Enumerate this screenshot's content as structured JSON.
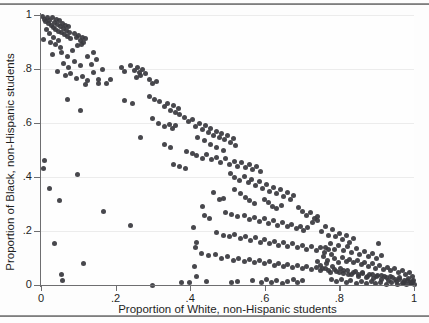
{
  "chart_data": {
    "type": "scatter",
    "title": "",
    "xlabel": "Proportion of White, non-Hispanic students",
    "ylabel": "Proportion of Black, non-Hispanic students",
    "xlim": [
      0,
      1
    ],
    "ylim": [
      0,
      1
    ],
    "xticks": [
      "0",
      ".2",
      ".4",
      ".6",
      ".8",
      "1"
    ],
    "xtick_values": [
      0,
      0.2,
      0.4,
      0.6,
      0.8,
      1
    ],
    "yticks": [
      "0",
      ".2",
      ".4",
      ".6",
      ".8",
      "1"
    ],
    "ytick_values": [
      0,
      0.2,
      0.4,
      0.6,
      0.8,
      1
    ],
    "grid": "horizontal-faint",
    "legend": "none",
    "marker": {
      "shape": "circle",
      "color": "#3a3a3f",
      "size_px": 5
    },
    "points": [
      [
        0.005,
        0.995
      ],
      [
        0.01,
        0.985
      ],
      [
        0.012,
        0.975
      ],
      [
        0.018,
        0.99
      ],
      [
        0.02,
        0.968
      ],
      [
        0.024,
        0.98
      ],
      [
        0.028,
        0.962
      ],
      [
        0.03,
        0.992
      ],
      [
        0.033,
        0.955
      ],
      [
        0.036,
        0.972
      ],
      [
        0.04,
        0.948
      ],
      [
        0.042,
        0.985
      ],
      [
        0.045,
        0.965
      ],
      [
        0.048,
        0.94
      ],
      [
        0.05,
        0.978
      ],
      [
        0.053,
        0.958
      ],
      [
        0.056,
        0.935
      ],
      [
        0.058,
        0.97
      ],
      [
        0.06,
        0.95
      ],
      [
        0.063,
        0.928
      ],
      [
        0.065,
        0.962
      ],
      [
        0.068,
        0.944
      ],
      [
        0.07,
        0.92
      ],
      [
        0.073,
        0.956
      ],
      [
        0.076,
        0.936
      ],
      [
        0.08,
        0.912
      ],
      [
        0.015,
        0.945
      ],
      [
        0.022,
        0.93
      ],
      [
        0.034,
        0.918
      ],
      [
        0.046,
        0.905
      ],
      [
        0.008,
        0.908
      ],
      [
        0.026,
        0.898
      ],
      [
        0.038,
        0.89
      ],
      [
        0.052,
        0.88
      ],
      [
        0.09,
        0.93
      ],
      [
        0.095,
        0.915
      ],
      [
        0.1,
        0.925
      ],
      [
        0.105,
        0.905
      ],
      [
        0.11,
        0.918
      ],
      [
        0.115,
        0.9
      ],
      [
        0.12,
        0.912
      ],
      [
        0.108,
        0.892
      ],
      [
        0.098,
        0.888
      ],
      [
        0.03,
        0.855
      ],
      [
        0.055,
        0.862
      ],
      [
        0.07,
        0.845
      ],
      [
        0.085,
        0.868
      ],
      [
        0.06,
        0.82
      ],
      [
        0.075,
        0.805
      ],
      [
        0.09,
        0.828
      ],
      [
        0.105,
        0.812
      ],
      [
        0.125,
        0.845
      ],
      [
        0.14,
        0.86
      ],
      [
        0.15,
        0.835
      ],
      [
        0.135,
        0.818
      ],
      [
        0.045,
        0.79
      ],
      [
        0.065,
        0.775
      ],
      [
        0.08,
        0.782
      ],
      [
        0.095,
        0.765
      ],
      [
        0.11,
        0.772
      ],
      [
        0.125,
        0.758
      ],
      [
        0.14,
        0.788
      ],
      [
        0.155,
        0.762
      ],
      [
        0.165,
        0.8
      ],
      [
        0.175,
        0.745
      ],
      [
        0.185,
        0.76
      ],
      [
        0.215,
        0.805
      ],
      [
        0.225,
        0.79
      ],
      [
        0.24,
        0.812
      ],
      [
        0.25,
        0.795
      ],
      [
        0.258,
        0.805
      ],
      [
        0.265,
        0.788
      ],
      [
        0.272,
        0.8
      ],
      [
        0.28,
        0.782
      ],
      [
        0.255,
        0.768
      ],
      [
        0.268,
        0.775
      ],
      [
        0.07,
        0.688
      ],
      [
        0.105,
        0.648
      ],
      [
        0.12,
        0.742
      ],
      [
        0.155,
        0.745
      ],
      [
        0.29,
        0.76
      ],
      [
        0.3,
        0.745
      ],
      [
        0.31,
        0.752
      ],
      [
        0.225,
        0.685
      ],
      [
        0.245,
        0.672
      ],
      [
        0.29,
        0.7
      ],
      [
        0.305,
        0.688
      ],
      [
        0.318,
        0.678
      ],
      [
        0.33,
        0.66
      ],
      [
        0.34,
        0.672
      ],
      [
        0.348,
        0.648
      ],
      [
        0.355,
        0.665
      ],
      [
        0.36,
        0.64
      ],
      [
        0.368,
        0.655
      ],
      [
        0.372,
        0.632
      ],
      [
        0.3,
        0.615
      ],
      [
        0.315,
        0.6
      ],
      [
        0.33,
        0.588
      ],
      [
        0.345,
        0.595
      ],
      [
        0.352,
        0.578
      ],
      [
        0.36,
        0.59
      ],
      [
        0.268,
        0.545
      ],
      [
        0.385,
        0.62
      ],
      [
        0.395,
        0.605
      ],
      [
        0.405,
        0.612
      ],
      [
        0.415,
        0.588
      ],
      [
        0.425,
        0.6
      ],
      [
        0.432,
        0.575
      ],
      [
        0.44,
        0.592
      ],
      [
        0.448,
        0.565
      ],
      [
        0.455,
        0.58
      ],
      [
        0.462,
        0.555
      ],
      [
        0.47,
        0.57
      ],
      [
        0.478,
        0.545
      ],
      [
        0.485,
        0.56
      ],
      [
        0.492,
        0.538
      ],
      [
        0.5,
        0.552
      ],
      [
        0.508,
        0.528
      ],
      [
        0.515,
        0.542
      ],
      [
        0.522,
        0.518
      ],
      [
        0.42,
        0.548
      ],
      [
        0.438,
        0.535
      ],
      [
        0.455,
        0.522
      ],
      [
        0.47,
        0.51
      ],
      [
        0.488,
        0.5
      ],
      [
        0.33,
        0.522
      ],
      [
        0.348,
        0.508
      ],
      [
        0.39,
        0.495
      ],
      [
        0.405,
        0.488
      ],
      [
        0.418,
        0.478
      ],
      [
        0.432,
        0.47
      ],
      [
        0.445,
        0.482
      ],
      [
        0.458,
        0.465
      ],
      [
        0.47,
        0.472
      ],
      [
        0.482,
        0.455
      ],
      [
        0.495,
        0.468
      ],
      [
        0.505,
        0.448
      ],
      [
        0.518,
        0.458
      ],
      [
        0.528,
        0.44
      ],
      [
        0.538,
        0.452
      ],
      [
        0.548,
        0.435
      ],
      [
        0.558,
        0.445
      ],
      [
        0.568,
        0.428
      ],
      [
        0.578,
        0.438
      ],
      [
        0.588,
        0.42
      ],
      [
        0.355,
        0.448
      ],
      [
        0.372,
        0.44
      ],
      [
        0.388,
        0.432
      ],
      [
        0.01,
        0.462
      ],
      [
        0.008,
        0.432
      ],
      [
        0.022,
        0.358
      ],
      [
        0.05,
        0.312
      ],
      [
        0.098,
        0.408
      ],
      [
        0.168,
        0.272
      ],
      [
        0.24,
        0.222
      ],
      [
        0.3,
        0.0
      ],
      [
        0.035,
        0.155
      ],
      [
        0.055,
        0.04
      ],
      [
        0.057,
        0.018
      ],
      [
        0.115,
        0.078
      ],
      [
        0.398,
        0.01
      ],
      [
        0.418,
        0.03
      ],
      [
        0.412,
        0.068
      ],
      [
        0.415,
        0.138
      ],
      [
        0.418,
        0.158
      ],
      [
        0.408,
        0.212
      ],
      [
        0.438,
        0.258
      ],
      [
        0.452,
        0.248
      ],
      [
        0.478,
        0.318
      ],
      [
        0.488,
        0.322
      ],
      [
        0.462,
        0.342
      ],
      [
        0.432,
        0.29
      ],
      [
        0.508,
        0.412
      ],
      [
        0.52,
        0.398
      ],
      [
        0.532,
        0.388
      ],
      [
        0.545,
        0.402
      ],
      [
        0.555,
        0.378
      ],
      [
        0.565,
        0.392
      ],
      [
        0.575,
        0.368
      ],
      [
        0.585,
        0.382
      ],
      [
        0.595,
        0.358
      ],
      [
        0.605,
        0.372
      ],
      [
        0.612,
        0.348
      ],
      [
        0.622,
        0.362
      ],
      [
        0.632,
        0.34
      ],
      [
        0.642,
        0.352
      ],
      [
        0.65,
        0.328
      ],
      [
        0.66,
        0.342
      ],
      [
        0.668,
        0.318
      ],
      [
        0.678,
        0.33
      ],
      [
        0.52,
        0.352
      ],
      [
        0.535,
        0.338
      ],
      [
        0.548,
        0.325
      ],
      [
        0.56,
        0.312
      ],
      [
        0.572,
        0.302
      ],
      [
        0.598,
        0.318
      ],
      [
        0.61,
        0.305
      ],
      [
        0.62,
        0.292
      ],
      [
        0.632,
        0.282
      ],
      [
        0.645,
        0.295
      ],
      [
        0.495,
        0.27
      ],
      [
        0.512,
        0.262
      ],
      [
        0.528,
        0.252
      ],
      [
        0.545,
        0.258
      ],
      [
        0.558,
        0.242
      ],
      [
        0.572,
        0.25
      ],
      [
        0.585,
        0.235
      ],
      [
        0.598,
        0.245
      ],
      [
        0.61,
        0.228
      ],
      [
        0.622,
        0.238
      ],
      [
        0.635,
        0.222
      ],
      [
        0.648,
        0.232
      ],
      [
        0.66,
        0.215
      ],
      [
        0.672,
        0.225
      ],
      [
        0.685,
        0.208
      ],
      [
        0.695,
        0.218
      ],
      [
        0.705,
        0.202
      ],
      [
        0.715,
        0.212
      ],
      [
        0.69,
        0.288
      ],
      [
        0.702,
        0.272
      ],
      [
        0.712,
        0.258
      ],
      [
        0.722,
        0.268
      ],
      [
        0.732,
        0.248
      ],
      [
        0.742,
        0.255
      ],
      [
        0.728,
        0.232
      ],
      [
        0.74,
        0.238
      ],
      [
        0.47,
        0.195
      ],
      [
        0.488,
        0.185
      ],
      [
        0.505,
        0.178
      ],
      [
        0.52,
        0.188
      ],
      [
        0.535,
        0.172
      ],
      [
        0.548,
        0.18
      ],
      [
        0.562,
        0.165
      ],
      [
        0.575,
        0.175
      ],
      [
        0.588,
        0.158
      ],
      [
        0.6,
        0.168
      ],
      [
        0.612,
        0.152
      ],
      [
        0.625,
        0.162
      ],
      [
        0.638,
        0.148
      ],
      [
        0.65,
        0.158
      ],
      [
        0.662,
        0.142
      ],
      [
        0.675,
        0.152
      ],
      [
        0.688,
        0.138
      ],
      [
        0.7,
        0.148
      ],
      [
        0.712,
        0.132
      ],
      [
        0.725,
        0.142
      ],
      [
        0.738,
        0.128
      ],
      [
        0.75,
        0.138
      ],
      [
        0.76,
        0.122
      ],
      [
        0.772,
        0.132
      ],
      [
        0.752,
        0.198
      ],
      [
        0.762,
        0.215
      ],
      [
        0.772,
        0.185
      ],
      [
        0.782,
        0.205
      ],
      [
        0.79,
        0.178
      ],
      [
        0.8,
        0.192
      ],
      [
        0.808,
        0.168
      ],
      [
        0.818,
        0.182
      ],
      [
        0.828,
        0.158
      ],
      [
        0.838,
        0.172
      ],
      [
        0.43,
        0.118
      ],
      [
        0.45,
        0.108
      ],
      [
        0.468,
        0.112
      ],
      [
        0.485,
        0.098
      ],
      [
        0.5,
        0.105
      ],
      [
        0.515,
        0.092
      ],
      [
        0.53,
        0.1
      ],
      [
        0.545,
        0.088
      ],
      [
        0.558,
        0.095
      ],
      [
        0.572,
        0.082
      ],
      [
        0.585,
        0.09
      ],
      [
        0.598,
        0.078
      ],
      [
        0.612,
        0.086
      ],
      [
        0.625,
        0.072
      ],
      [
        0.638,
        0.08
      ],
      [
        0.65,
        0.068
      ],
      [
        0.662,
        0.076
      ],
      [
        0.675,
        0.064
      ],
      [
        0.688,
        0.072
      ],
      [
        0.7,
        0.06
      ],
      [
        0.712,
        0.068
      ],
      [
        0.725,
        0.058
      ],
      [
        0.738,
        0.065
      ],
      [
        0.75,
        0.052
      ],
      [
        0.762,
        0.06
      ],
      [
        0.775,
        0.048
      ],
      [
        0.788,
        0.056
      ],
      [
        0.8,
        0.045
      ],
      [
        0.812,
        0.052
      ],
      [
        0.825,
        0.04
      ],
      [
        0.838,
        0.048
      ],
      [
        0.85,
        0.038
      ],
      [
        0.862,
        0.045
      ],
      [
        0.875,
        0.032
      ],
      [
        0.888,
        0.04
      ],
      [
        0.9,
        0.03
      ],
      [
        0.912,
        0.036
      ],
      [
        0.925,
        0.026
      ],
      [
        0.938,
        0.032
      ],
      [
        0.95,
        0.022
      ],
      [
        0.962,
        0.028
      ],
      [
        0.975,
        0.018
      ],
      [
        0.985,
        0.024
      ],
      [
        0.995,
        0.012
      ],
      [
        0.378,
        0.01
      ],
      [
        0.445,
        0.012
      ],
      [
        0.512,
        0.008
      ],
      [
        0.528,
        0.012
      ],
      [
        0.568,
        0.018
      ],
      [
        0.59,
        0.008
      ],
      [
        0.605,
        0.02
      ],
      [
        0.618,
        0.01
      ],
      [
        0.632,
        0.016
      ],
      [
        0.648,
        0.006
      ],
      [
        0.662,
        0.014
      ],
      [
        0.678,
        0.022
      ],
      [
        0.688,
        0.008
      ],
      [
        0.7,
        0.016
      ],
      [
        0.758,
        0.105
      ],
      [
        0.768,
        0.092
      ],
      [
        0.778,
        0.112
      ],
      [
        0.788,
        0.098
      ],
      [
        0.798,
        0.085
      ],
      [
        0.808,
        0.102
      ],
      [
        0.818,
        0.088
      ],
      [
        0.828,
        0.095
      ],
      [
        0.838,
        0.082
      ],
      [
        0.848,
        0.09
      ],
      [
        0.858,
        0.075
      ],
      [
        0.868,
        0.085
      ],
      [
        0.878,
        0.07
      ],
      [
        0.888,
        0.078
      ],
      [
        0.898,
        0.062
      ],
      [
        0.908,
        0.072
      ],
      [
        0.918,
        0.058
      ],
      [
        0.928,
        0.066
      ],
      [
        0.938,
        0.052
      ],
      [
        0.948,
        0.06
      ],
      [
        0.958,
        0.045
      ],
      [
        0.968,
        0.052
      ],
      [
        0.978,
        0.04
      ],
      [
        0.988,
        0.046
      ],
      [
        0.762,
        0.14
      ],
      [
        0.775,
        0.155
      ],
      [
        0.788,
        0.132
      ],
      [
        0.798,
        0.148
      ],
      [
        0.81,
        0.128
      ],
      [
        0.822,
        0.142
      ],
      [
        0.832,
        0.12
      ],
      [
        0.845,
        0.135
      ],
      [
        0.855,
        0.112
      ],
      [
        0.868,
        0.125
      ],
      [
        0.878,
        0.105
      ],
      [
        0.89,
        0.118
      ],
      [
        0.9,
        0.098
      ],
      [
        0.912,
        0.108
      ],
      [
        0.905,
        0.152
      ],
      [
        0.74,
        0.088
      ],
      [
        0.748,
        0.072
      ],
      [
        0.755,
        0.062
      ],
      [
        0.765,
        0.078
      ],
      [
        0.772,
        0.055
      ],
      [
        0.782,
        0.068
      ],
      [
        0.792,
        0.05
      ],
      [
        0.802,
        0.062
      ],
      [
        0.812,
        0.042
      ],
      [
        0.822,
        0.055
      ],
      [
        0.832,
        0.038
      ],
      [
        0.842,
        0.05
      ],
      [
        0.852,
        0.032
      ],
      [
        0.862,
        0.044
      ],
      [
        0.872,
        0.028
      ],
      [
        0.882,
        0.038
      ],
      [
        0.892,
        0.024
      ],
      [
        0.902,
        0.034
      ],
      [
        0.912,
        0.02
      ],
      [
        0.922,
        0.03
      ],
      [
        0.932,
        0.016
      ],
      [
        0.942,
        0.026
      ],
      [
        0.952,
        0.012
      ],
      [
        0.962,
        0.02
      ],
      [
        0.972,
        0.01
      ],
      [
        0.982,
        0.016
      ],
      [
        0.992,
        0.006
      ],
      [
        0.778,
        0.02
      ],
      [
        0.792,
        0.012
      ],
      [
        0.805,
        0.022
      ],
      [
        0.818,
        0.008
      ],
      [
        0.83,
        0.018
      ],
      [
        0.845,
        0.006
      ],
      [
        0.858,
        0.014
      ],
      [
        0.872,
        0.004
      ],
      [
        0.885,
        0.012
      ],
      [
        0.898,
        0.004
      ],
      [
        0.91,
        0.01
      ],
      [
        0.925,
        0.003
      ],
      [
        0.94,
        0.008
      ],
      [
        0.955,
        0.002
      ],
      [
        0.968,
        0.006
      ],
      [
        0.98,
        0.002
      ],
      [
        0.992,
        0.004
      ],
      [
        1.0,
        0.002
      ],
      [
        0.998,
        0.018
      ],
      [
        0.995,
        0.032
      ],
      [
        0.99,
        0.008
      ]
    ]
  }
}
